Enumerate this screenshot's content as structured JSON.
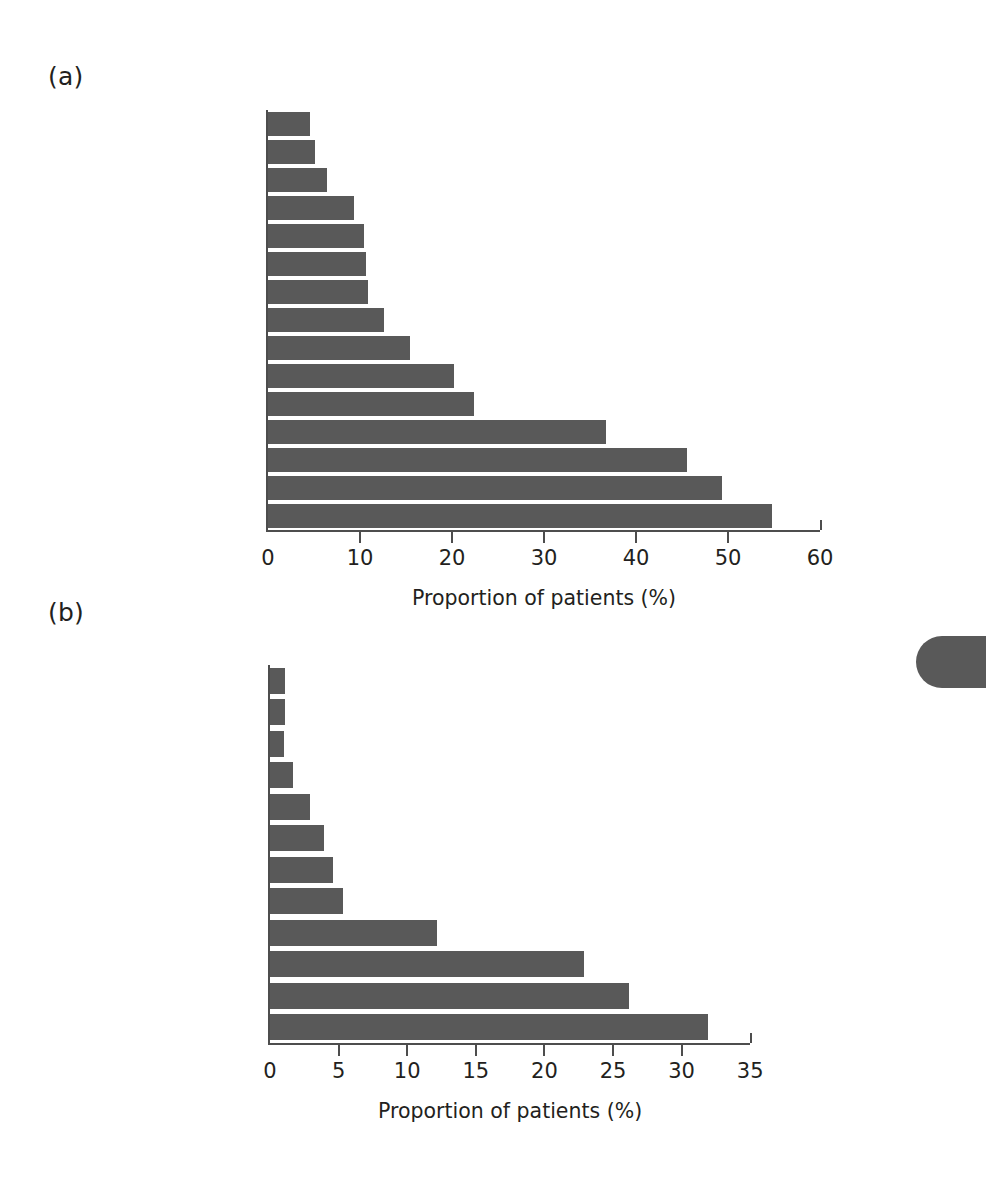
{
  "figure": {
    "background": "#ffffff",
    "bar_color": "#595959",
    "axis_color": "#4d4d4d",
    "text_color": "#231f20"
  },
  "panels": [
    {
      "label": "(a)",
      "axis_title": "Proportion of patients (%)",
      "ticks": [
        "0",
        "10",
        "20",
        "30",
        "40",
        "50",
        "60"
      ]
    },
    {
      "label": "(b)",
      "axis_title": "Proportion of patients (%)",
      "ticks": [
        "0",
        "5",
        "10",
        "15",
        "20",
        "25",
        "30",
        "35"
      ]
    }
  ],
  "chart_data": [
    {
      "type": "bar",
      "orientation": "horizontal",
      "panel": "(a)",
      "title": "",
      "xlabel": "Proportion of patients (%)",
      "ylabel": "",
      "xlim": [
        0,
        60
      ],
      "xticks": [
        0,
        10,
        20,
        30,
        40,
        50,
        60
      ],
      "grid": false,
      "legend": "none",
      "categories": [
        "None",
        "Psychiatric disorder",
        "Dermatitis herpetiformis",
        "Flatus",
        "Vomiting",
        "Dyspepsia",
        "Nausea",
        "Mouth ulcers",
        "Flatulence",
        "Anorexia",
        "Abdominal pain",
        "Abdominal distension",
        "Weight loss",
        "Lethargy",
        "Diarrhea"
      ],
      "values": [
        4.6,
        5.1,
        6.4,
        9.4,
        10.4,
        10.7,
        10.9,
        12.6,
        15.4,
        20.2,
        22.4,
        36.7,
        45.5,
        49.3,
        54.8
      ]
    },
    {
      "type": "bar",
      "orientation": "horizontal",
      "panel": "(b)",
      "title": "",
      "xlabel": "Proportion of patients (%)",
      "ylabel": "",
      "xlim": [
        0,
        35
      ],
      "xticks": [
        0,
        5,
        10,
        15,
        20,
        25,
        30,
        35
      ],
      "grid": false,
      "legend": "none",
      "categories": [
        "Mouth ulcers",
        "Dehydration",
        "Myopathy",
        "Clubbing",
        "Glossitis",
        "Edema",
        "Short stature",
        "Dermatitis herpetiformis",
        "Abdominal distension",
        "Wasting",
        "Anemia",
        "None"
      ],
      "values": [
        1.1,
        1.1,
        1.0,
        1.7,
        2.9,
        3.9,
        4.6,
        5.3,
        12.2,
        22.9,
        26.2,
        31.9
      ]
    }
  ]
}
